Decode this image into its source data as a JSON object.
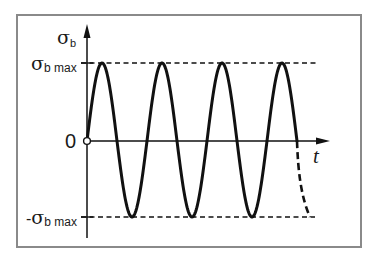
{
  "diagram": {
    "type": "sinusoidal stress-time diagram (fully reversed bending stress)",
    "y_axis_label": "σ",
    "y_axis_label_sub": "b",
    "x_axis_label": "t",
    "max_label_symbol": "σ",
    "max_label_sub": "b max",
    "min_label_prefix": "-",
    "min_label_symbol": "σ",
    "min_label_sub": "b max",
    "zero_label": "0",
    "colors": {
      "frame": "#8a8a8a",
      "curve": "#111111",
      "axes": "#111111",
      "dashed": "#111111",
      "background": "#ffffff"
    }
  },
  "chart_data": {
    "type": "line",
    "title": "",
    "xlabel": "t",
    "ylabel": "σb",
    "ytick_labels": [
      "σb max",
      "0",
      "-σb max"
    ],
    "series": [
      {
        "name": "σb(t) solid",
        "style": "solid",
        "description": "sine wave starting at 0, 3.5 cycles: 4 peaks at +σb max, 3 troughs at -σb max",
        "x_cycles": [
          0,
          0.25,
          0.5,
          0.75,
          1.0,
          1.25,
          1.5,
          1.75,
          2.0,
          2.25,
          2.5,
          2.75,
          3.0,
          3.25,
          3.5
        ],
        "y_normalized": [
          0,
          1,
          0,
          -1,
          0,
          1,
          0,
          -1,
          0,
          1,
          0,
          -1,
          0,
          1,
          0
        ]
      },
      {
        "name": "σb(t) continuation",
        "style": "dashed",
        "description": "dashed continuation from 0 down to -σb max",
        "x_cycles": [
          3.5,
          3.75
        ],
        "y_normalized": [
          0,
          -1
        ]
      }
    ],
    "reference_lines": [
      {
        "label": "σb max",
        "y_normalized": 1,
        "style": "dashed"
      },
      {
        "label": "-σb max",
        "y_normalized": -1,
        "style": "dashed"
      }
    ],
    "ylim_normalized": [
      -1.3,
      1.5
    ]
  }
}
